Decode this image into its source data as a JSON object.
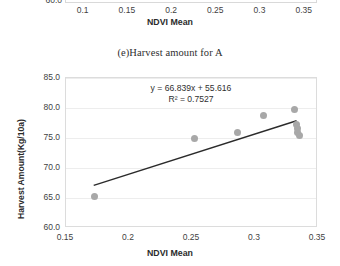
{
  "top_chart": {
    "visible_ytick": "60.0",
    "xticks": [
      "0.1",
      "0.15",
      "0.2",
      "0.25",
      "0.3",
      "0.35"
    ],
    "xlabel": "NDVI Mean"
  },
  "chart_data": {
    "type": "scatter",
    "title": "(e)Harvest amount for A",
    "xlabel": "NDVI Mean",
    "ylabel": "Harvest Amount(Kg/10a)",
    "xlim": [
      0.15,
      0.35
    ],
    "ylim": [
      60.0,
      85.0
    ],
    "xticks": [
      "0.15",
      "0.2",
      "0.25",
      "0.3",
      "0.35"
    ],
    "xtick_values": [
      0.15,
      0.2,
      0.25,
      0.3,
      0.35
    ],
    "yticks": [
      "60.0",
      "65.0",
      "70.0",
      "75.0",
      "80.0",
      "85.0"
    ],
    "ytick_values": [
      60.0,
      65.0,
      70.0,
      75.0,
      80.0,
      85.0
    ],
    "grid": true,
    "legend": null,
    "annotations": {
      "equation": "y = 66.839x + 55.616",
      "r_squared": "R² = 0.7527"
    },
    "point_color": "#a8a8a8",
    "line_color": "#2b2b2b",
    "series": [
      {
        "name": "Harvest amount for A",
        "x": [
          0.173,
          0.252,
          0.286,
          0.307,
          0.331,
          0.333,
          0.334,
          0.334,
          0.335
        ],
        "y": [
          65.3,
          74.9,
          75.9,
          78.7,
          79.8,
          77.2,
          76.6,
          76.0,
          75.5
        ]
      }
    ],
    "fit": {
      "slope": 66.839,
      "intercept": 55.616,
      "r2": 0.7527,
      "x_start": 0.172,
      "x_end": 0.333
    }
  }
}
